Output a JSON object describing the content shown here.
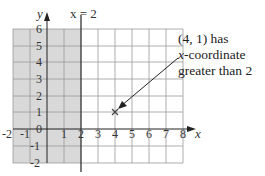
{
  "diagram": {
    "type": "coordinate-grid",
    "x_axis": {
      "label": "x",
      "min": -2,
      "max": 8,
      "ticks": [
        "-2",
        "-1",
        "0",
        "1",
        "2",
        "3",
        "4",
        "5",
        "6",
        "7",
        "8"
      ]
    },
    "y_axis": {
      "label": "y",
      "min": -2,
      "max": 6,
      "ticks": [
        "6",
        "5",
        "4",
        "3",
        "2",
        "1",
        "-1",
        "-2"
      ]
    },
    "vertical_line": {
      "label": "x = 2",
      "x": 2
    },
    "shaded_region": {
      "description": "x < 2",
      "x_from": -2,
      "x_to": 2,
      "color": "#d9d9d9"
    },
    "point": {
      "x": 4,
      "y": 1,
      "marker": "cross"
    },
    "callout": {
      "line1": "(4, 1) has",
      "line2_italic": "x",
      "line2_rest": "-coordinate",
      "line3": "greater than 2"
    },
    "colors": {
      "grid": "#9a9a9a",
      "axis": "#222222",
      "shade": "#d9d9d9"
    }
  }
}
